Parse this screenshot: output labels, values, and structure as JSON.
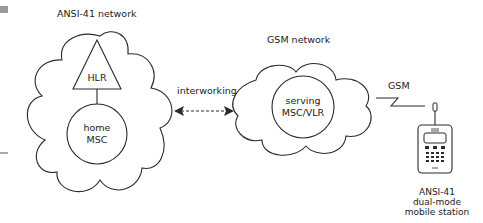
{
  "diagram": {
    "colors": {
      "line": "#2a2a2a",
      "text": "#222222",
      "background": "#ffffff",
      "marker": "#9a9a9a"
    },
    "networks": [
      {
        "id": "ansi41",
        "label": "ANSI-41 network",
        "shape": "cloud",
        "nodes": [
          {
            "id": "hlr",
            "label": "HLR",
            "shape": "triangle"
          },
          {
            "id": "home_msc",
            "label_line1": "home",
            "label_line2": "MSC",
            "shape": "circle"
          }
        ]
      },
      {
        "id": "gsm",
        "label": "GSM network",
        "shape": "cloud",
        "nodes": [
          {
            "id": "serving_msc_vlr",
            "label_line1": "serving",
            "label_line2": "MSC/VLR",
            "shape": "circle"
          }
        ]
      }
    ],
    "links": [
      {
        "from": "ansi41",
        "to": "gsm",
        "label": "interworking",
        "style": "dashed-bidirectional-arrow"
      },
      {
        "from": "gsm",
        "to": "mobile_station",
        "label": "GSM",
        "style": "radio-zigzag"
      },
      {
        "from": "hlr",
        "to": "home_msc",
        "label": "",
        "style": "solid"
      }
    ],
    "mobile_station": {
      "icon": "mobile-phone-icon",
      "label_line1": "ANSI-41",
      "label_line2": "dual-mode",
      "label_line3": "mobile station"
    }
  }
}
